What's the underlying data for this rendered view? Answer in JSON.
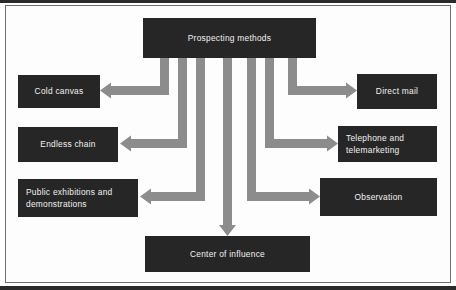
{
  "diagram": {
    "title": "Prospecting methods",
    "colors": {
      "node_fill": "#262626",
      "node_text": "#f2f2f2",
      "arrow_fill": "#8c8c8c",
      "frame_border": "#6f6f6f",
      "page_background": "#ffffff",
      "scan_band": "#2b2b2b"
    },
    "root": {
      "label": "Prospecting methods",
      "x": 143,
      "y": 18,
      "w": 173,
      "h": 40
    },
    "branches": [
      {
        "label": "Cold canvas",
        "side": "left",
        "x": 18,
        "y": 75,
        "w": 82,
        "h": 33,
        "align": "center"
      },
      {
        "label": "Endless chain",
        "side": "left",
        "x": 18,
        "y": 127,
        "w": 100,
        "h": 35,
        "align": "center"
      },
      {
        "label": "Public exhibitions and\ndemonstrations",
        "side": "left",
        "x": 18,
        "y": 179,
        "w": 120,
        "h": 38,
        "align": "left"
      },
      {
        "label": "Direct mail",
        "side": "right",
        "x": 357,
        "y": 74,
        "w": 80,
        "h": 35,
        "align": "center"
      },
      {
        "label": "Telephone and\ntelemarketing",
        "side": "right",
        "x": 338,
        "y": 126,
        "w": 99,
        "h": 36,
        "align": "left"
      },
      {
        "label": "Observation",
        "side": "right",
        "x": 320,
        "y": 178,
        "w": 117,
        "h": 38,
        "align": "center"
      },
      {
        "label": "Center of influence",
        "side": "bottom",
        "x": 145,
        "y": 236,
        "w": 165,
        "h": 36,
        "align": "center"
      }
    ],
    "arrows": [
      {
        "name": "arrow-to-cold-canvas",
        "direction": "left",
        "stem_x": 160,
        "bend_y": 86,
        "tip_x": 100
      },
      {
        "name": "arrow-to-endless-chain",
        "direction": "left",
        "stem_x": 178,
        "bend_y": 139,
        "tip_x": 120
      },
      {
        "name": "arrow-to-public-exhibitions",
        "direction": "left",
        "stem_x": 196,
        "bend_y": 192,
        "tip_x": 140
      },
      {
        "name": "arrow-to-center-of-influence",
        "direction": "down",
        "stem_x": 223,
        "bend_y": 236,
        "tip_x": 227
      },
      {
        "name": "arrow-to-observation",
        "direction": "right",
        "stem_x": 247,
        "bend_y": 192,
        "tip_x": 320
      },
      {
        "name": "arrow-to-telephone",
        "direction": "right",
        "stem_x": 265,
        "bend_y": 139,
        "tip_x": 338
      },
      {
        "name": "arrow-to-direct-mail",
        "direction": "right",
        "stem_x": 288,
        "bend_y": 86,
        "tip_x": 357
      }
    ]
  }
}
